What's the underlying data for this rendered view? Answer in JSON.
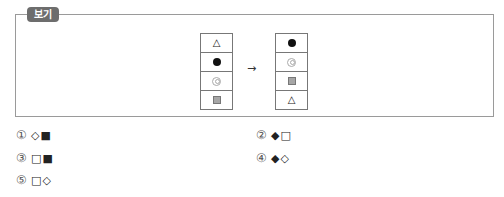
{
  "bogi": {
    "label": "보기",
    "before": [
      "△",
      "●",
      "◎",
      "■"
    ],
    "arrow": "→",
    "after": [
      "●",
      "◎",
      "■",
      "△"
    ]
  },
  "choices": [
    {
      "num": "①",
      "symbols": "◇■"
    },
    {
      "num": "②",
      "symbols": "◆□"
    },
    {
      "num": "③",
      "symbols": "□■"
    },
    {
      "num": "④",
      "symbols": "◆◇"
    },
    {
      "num": "⑤",
      "symbols": "□◇"
    }
  ]
}
